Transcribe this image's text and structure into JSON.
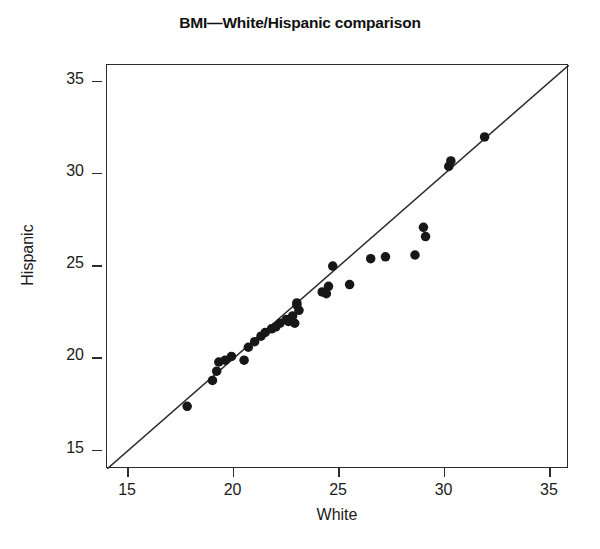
{
  "chart_data": {
    "type": "scatter",
    "title": "BMI—White/Hispanic comparison",
    "xlabel": "White",
    "ylabel": "Hispanic",
    "xlim": [
      14,
      35.9
    ],
    "ylim": [
      14,
      35.9
    ],
    "xticks": [
      15,
      20,
      25,
      30,
      35
    ],
    "yticks": [
      15,
      20,
      25,
      30,
      35
    ],
    "xticklabels": [
      "15",
      "20",
      "25",
      "30",
      "35"
    ],
    "yticklabels": [
      "15",
      "20",
      "25",
      "30",
      "35"
    ],
    "grid": false,
    "legend": null,
    "reference_line": {
      "type": "identity",
      "label": "y = x",
      "x_start": 14.0,
      "y_start": 14.0,
      "x_end": 35.9,
      "y_end": 35.9
    },
    "marker": {
      "shape": "circle",
      "filled": true,
      "color": "#171717",
      "size_px": 9.5
    },
    "series": [
      {
        "name": "BMI pairs",
        "points": [
          [
            17.8,
            17.4
          ],
          [
            19.0,
            18.8
          ],
          [
            19.2,
            19.3
          ],
          [
            19.3,
            19.8
          ],
          [
            19.6,
            19.9
          ],
          [
            19.9,
            20.1
          ],
          [
            20.5,
            19.9
          ],
          [
            20.7,
            20.6
          ],
          [
            21.0,
            20.9
          ],
          [
            21.3,
            21.2
          ],
          [
            21.5,
            21.4
          ],
          [
            21.8,
            21.6
          ],
          [
            22.0,
            21.7
          ],
          [
            22.2,
            21.9
          ],
          [
            22.5,
            22.1
          ],
          [
            22.6,
            22.0
          ],
          [
            22.8,
            22.3
          ],
          [
            22.9,
            21.9
          ],
          [
            23.0,
            22.9
          ],
          [
            23.0,
            23.0
          ],
          [
            23.1,
            22.6
          ],
          [
            24.2,
            23.6
          ],
          [
            24.4,
            23.5
          ],
          [
            24.5,
            23.9
          ],
          [
            24.7,
            25.0
          ],
          [
            25.5,
            24.0
          ],
          [
            26.5,
            25.4
          ],
          [
            27.2,
            25.5
          ],
          [
            28.6,
            25.6
          ],
          [
            29.0,
            27.1
          ],
          [
            29.1,
            26.6
          ],
          [
            30.2,
            30.4
          ],
          [
            30.3,
            30.7
          ],
          [
            31.9,
            32.0
          ]
        ]
      }
    ]
  }
}
